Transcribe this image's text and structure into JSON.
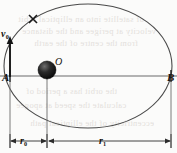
{
  "figure": {
    "type": "physics-orbit-diagram",
    "background_color": "#fbfbfa",
    "stroke_color": "#4a4a4a",
    "label_color": "#15120f"
  },
  "labels": {
    "point_a": "A",
    "point_b": "B",
    "center_o": "O",
    "velocity": "v",
    "velocity_sub": "0",
    "radius_inner": "r",
    "radius_inner_sub": "0",
    "radius_outer": "r",
    "radius_outer_sub": "1"
  },
  "geometry": {
    "ellipse_center_x": 88,
    "ellipse_center_y": 66,
    "ellipse_rx": 84,
    "ellipse_ry": 62,
    "axis_y": 76,
    "mass_x": 47,
    "mass_y": 70,
    "mass_radius": 9,
    "point_a_x": 10,
    "point_b_x": 171,
    "dimension_line_y": 141,
    "cross_mark_x": 33,
    "cross_mark_y": 19
  },
  "bleed_through_text": [
    "of satellite into an elliptical orbit",
    "velocity at perigee and the distance",
    "from the centre of the earth",
    "the orbit has a period of",
    "calculate the speed at apogee",
    "eccentricity of the elliptical path"
  ]
}
